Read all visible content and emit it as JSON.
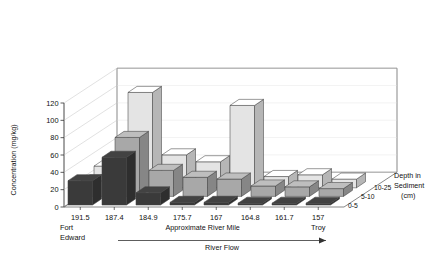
{
  "chart_data": {
    "type": "bar",
    "render": "3d-grouped",
    "title": "",
    "xlabel": "Approximate River Mile",
    "ylabel": "Concentration (mg/kg)",
    "zlabel": "Depth in Sediment (cm)",
    "categories": [
      "191.5",
      "187.4",
      "184.9",
      "175.7",
      "167",
      "164.8",
      "161.7",
      "157"
    ],
    "ylim": [
      0,
      120
    ],
    "yticks": [
      0,
      20,
      40,
      60,
      80,
      100,
      120
    ],
    "ytick_labels": [
      "0",
      "20",
      "40",
      "60",
      "80",
      "100",
      "120"
    ],
    "grid": true,
    "series": [
      {
        "name": "0-5",
        "color": "#3a3a3a",
        "values": [
          28,
          55,
          14,
          3,
          3,
          2,
          2,
          2
        ]
      },
      {
        "name": "5-10",
        "color": "#a8a8a8",
        "values": [
          18,
          68,
          30,
          22,
          20,
          12,
          11,
          9
        ]
      },
      {
        "name": "10-25",
        "color": "#e4e4e4",
        "values": [
          25,
          110,
          38,
          30,
          95,
          13,
          15,
          10
        ]
      }
    ],
    "annotations": {
      "left_place": [
        "Fort",
        "Edward"
      ],
      "right_place": "Troy",
      "flow_label": "River Flow",
      "flow_direction": "left-to-right"
    },
    "legend": {
      "position": "right-depth-axis",
      "entries": [
        "0-5",
        "5-10",
        "10-25"
      ],
      "title_lines": [
        "Depth in",
        "Sediment",
        "(cm)"
      ]
    }
  },
  "axis": {
    "y_title": "Concentration (mg/kg)",
    "x_title": "Approximate River Mile",
    "z_title_line1": "Depth in",
    "z_title_line2": "Sediment",
    "z_title_line3": "(cm)"
  },
  "places": {
    "fort": "Fort",
    "edward": "Edward",
    "troy": "Troy"
  },
  "flow": {
    "label": "River Flow"
  }
}
